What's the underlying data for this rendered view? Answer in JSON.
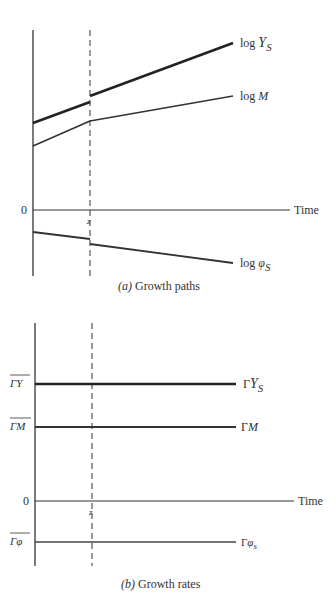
{
  "panel_a": {
    "caption_prefix": "(a)",
    "caption_text": " Growth paths",
    "origin_label": "0",
    "time_label": "Time",
    "switch_label": "z",
    "series": [
      {
        "id": "logYs",
        "label_pre": "log ",
        "label_var": "Y",
        "label_sub": "S",
        "style": "thick",
        "before": [
          123,
          102
        ],
        "after": [
          96,
          43
        ]
      },
      {
        "id": "logM",
        "label_pre": "log ",
        "label_var": "M",
        "label_sub": "",
        "style": "medium",
        "before": [
          146,
          121
        ],
        "after": [
          121,
          96
        ]
      },
      {
        "id": "logPhis",
        "label_pre": "log ",
        "label_var": "φ",
        "label_sub": "S",
        "style": "medium",
        "before": [
          232,
          239
        ],
        "after": [
          244,
          263
        ]
      }
    ]
  },
  "panel_b": {
    "caption_prefix": "(b)",
    "caption_text": " Growth rates",
    "origin_label": "0",
    "time_label": "Time",
    "switch_label": "z",
    "series": [
      {
        "id": "gammaYs",
        "axis_label": "ΓY",
        "label_pre": "Γ",
        "label_var": "Y",
        "label_sub": "S",
        "style": "thick"
      },
      {
        "id": "gammaM",
        "axis_label": "ΓM",
        "label_pre": "Γ",
        "label_var": "M",
        "label_sub": "",
        "style": "medium"
      },
      {
        "id": "gammaPhis",
        "axis_label": "Γφ",
        "label_pre": "Γ",
        "label_var": "φ",
        "label_sub": "s",
        "style": "thin"
      }
    ]
  }
}
